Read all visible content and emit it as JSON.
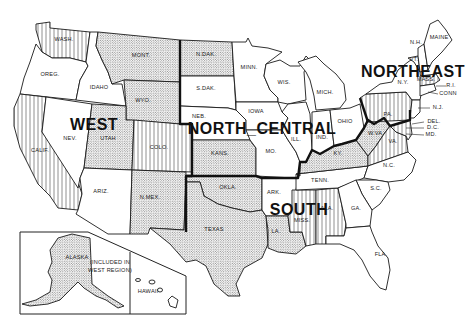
{
  "map": {
    "title": "U.S. Census Regions",
    "regions": [
      {
        "id": "west",
        "label": "WEST",
        "x": 94,
        "y": 130
      },
      {
        "id": "north_central",
        "label": "NORTH_CENTRAL",
        "x": 262,
        "y": 134
      },
      {
        "id": "south",
        "label": "SOUTH",
        "x": 299,
        "y": 215
      },
      {
        "id": "northeast",
        "label": "NORTHEAST",
        "x": 413,
        "y": 77
      }
    ],
    "states": [
      {
        "abbr": "WASH.",
        "region": "West",
        "fill": "stripes",
        "lx": 64,
        "ly": 41
      },
      {
        "abbr": "OREG.",
        "region": "West",
        "fill": "plain",
        "lx": 50,
        "ly": 76
      },
      {
        "abbr": "CALIF.",
        "region": "West",
        "fill": "stripes",
        "lx": 40,
        "ly": 152
      },
      {
        "abbr": "NEV.",
        "region": "West",
        "fill": "plain",
        "lx": 70,
        "ly": 140
      },
      {
        "abbr": "IDAHO",
        "region": "West",
        "fill": "plain",
        "lx": 99,
        "ly": 89
      },
      {
        "abbr": "MONT.",
        "region": "West",
        "fill": "dots",
        "lx": 141,
        "ly": 57
      },
      {
        "abbr": "WYO.",
        "region": "West",
        "fill": "dots",
        "lx": 143,
        "ly": 102
      },
      {
        "abbr": "UTAH",
        "region": "West",
        "fill": "dots",
        "lx": 108,
        "ly": 140
      },
      {
        "abbr": "COLO.",
        "region": "West",
        "fill": "stripes",
        "lx": 159,
        "ly": 149
      },
      {
        "abbr": "ARIZ.",
        "region": "West",
        "fill": "plain",
        "lx": 101,
        "ly": 193
      },
      {
        "abbr": "N.MEX.",
        "region": "West",
        "fill": "dots",
        "lx": 150,
        "ly": 199
      },
      {
        "abbr": "N.DAK.",
        "region": "North Central",
        "fill": "dots",
        "lx": 206,
        "ly": 56
      },
      {
        "abbr": "S.DAK.",
        "region": "North Central",
        "fill": "plain",
        "lx": 206,
        "ly": 90
      },
      {
        "abbr": "NEB.",
        "region": "North Central",
        "fill": "plain",
        "lx": 199,
        "ly": 118
      },
      {
        "abbr": "KANS.",
        "region": "North Central",
        "fill": "dots",
        "lx": 220,
        "ly": 155
      },
      {
        "abbr": "MINN.",
        "region": "North Central",
        "fill": "plain",
        "lx": 249,
        "ly": 69
      },
      {
        "abbr": "IOWA",
        "region": "North Central",
        "fill": "plain",
        "lx": 256,
        "ly": 113
      },
      {
        "abbr": "MO.",
        "region": "North Central",
        "fill": "plain",
        "lx": 271,
        "ly": 153
      },
      {
        "abbr": "WIS.",
        "region": "North Central",
        "fill": "plain",
        "lx": 284,
        "ly": 84
      },
      {
        "abbr": "ILL.",
        "region": "North Central",
        "fill": "plain",
        "lx": 296,
        "ly": 141
      },
      {
        "abbr": "MICH.",
        "region": "North Central",
        "fill": "plain",
        "lx": 325,
        "ly": 94
      },
      {
        "abbr": "IND.",
        "region": "North Central",
        "fill": "plain",
        "lx": 322,
        "ly": 139
      },
      {
        "abbr": "OHIO",
        "region": "North Central",
        "fill": "plain",
        "lx": 345,
        "ly": 123
      },
      {
        "abbr": "OKLA.",
        "region": "South",
        "fill": "dots",
        "lx": 228,
        "ly": 189
      },
      {
        "abbr": "TEXAS",
        "region": "South",
        "fill": "dots",
        "lx": 214,
        "ly": 231
      },
      {
        "abbr": "ARK.",
        "region": "South",
        "fill": "plain",
        "lx": 274,
        "ly": 194
      },
      {
        "abbr": "LA.",
        "region": "South",
        "fill": "dots",
        "lx": 276,
        "ly": 233
      },
      {
        "abbr": "MISS.",
        "region": "South",
        "fill": "stripes",
        "lx": 302,
        "ly": 222
      },
      {
        "abbr": "ALA.",
        "region": "South",
        "fill": "stripes",
        "lx": 327,
        "ly": 210
      },
      {
        "abbr": "TENN.",
        "region": "South",
        "fill": "plain",
        "lx": 320,
        "ly": 182
      },
      {
        "abbr": "KY.",
        "region": "South",
        "fill": "dots",
        "lx": 338,
        "ly": 155
      },
      {
        "abbr": "W.VA.",
        "region": "South",
        "fill": "dots",
        "lx": 376,
        "ly": 135
      },
      {
        "abbr": "VA.",
        "region": "South",
        "fill": "stripes",
        "lx": 393,
        "ly": 143
      },
      {
        "abbr": "N.C.",
        "region": "South",
        "fill": "plain",
        "lx": 389,
        "ly": 167
      },
      {
        "abbr": "S.C.",
        "region": "South",
        "fill": "plain",
        "lx": 376,
        "ly": 190
      },
      {
        "abbr": "GA.",
        "region": "South",
        "fill": "plain",
        "lx": 356,
        "ly": 210
      },
      {
        "abbr": "FLA.",
        "region": "South",
        "fill": "plain",
        "lx": 381,
        "ly": 256
      },
      {
        "abbr": "PA.",
        "region": "Northeast",
        "fill": "stripes",
        "lx": 388,
        "ly": 116
      },
      {
        "abbr": "N.Y.",
        "region": "Northeast",
        "fill": "plain",
        "lx": 403,
        "ly": 84
      },
      {
        "abbr": "VT.",
        "region": "Northeast",
        "fill": "plain",
        "lx": 414,
        "ly": 61
      },
      {
        "abbr": "N.H.",
        "region": "Northeast",
        "fill": "plain",
        "lx": 416,
        "ly": 44
      },
      {
        "abbr": "MAINE",
        "region": "Northeast",
        "fill": "plain",
        "lx": 439,
        "ly": 39
      },
      {
        "abbr": "MASS.",
        "region": "Northeast",
        "fill": "stripes",
        "lx": 426,
        "ly": 81
      },
      {
        "abbr": "ALASKA",
        "region": "West",
        "fill": "dots",
        "lx": 77,
        "ly": 259
      },
      {
        "abbr": "HAWAII",
        "region": "West",
        "fill": "plain",
        "lx": 148,
        "ly": 293
      }
    ],
    "leader_labels": [
      {
        "text": "R.I.",
        "x": 451,
        "y": 87
      },
      {
        "text": "CONN",
        "x": 448,
        "y": 95
      },
      {
        "text": "N.J.",
        "x": 438,
        "y": 109
      },
      {
        "text": "DEL.",
        "x": 434,
        "y": 123
      },
      {
        "text": "D.C.",
        "x": 433,
        "y": 129
      },
      {
        "text": "MD.",
        "x": 431,
        "y": 136
      }
    ],
    "inset_note": {
      "line1": "(INCLUDED IN",
      "line2": "WEST REGION)"
    },
    "legend": {
      "pattern_colors": {
        "ink": "#1a1a1a",
        "paper": "#ffffff"
      }
    }
  }
}
